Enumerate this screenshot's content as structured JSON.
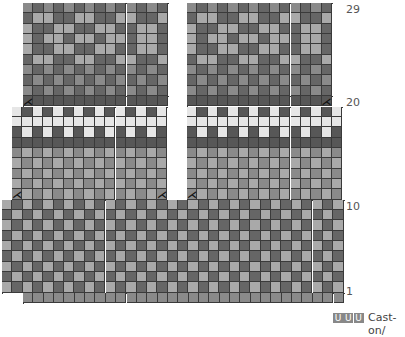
{
  "chart": {
    "cell_px": 10.35,
    "row_labels": [
      {
        "text": "29",
        "row": 29
      },
      {
        "text": "20",
        "row": 20
      },
      {
        "text": "10",
        "row": 10
      },
      {
        "text": "1",
        "row": 1
      }
    ],
    "legend": {
      "cast_on_symbol": "U",
      "cast_on_count": 3,
      "cast_on_label": "Cast-on/"
    },
    "colors": {
      "D": "#666666",
      "M": "#8a8a8a",
      "L": "#a9a9a9",
      "W": "#e6e6e6",
      "K": "#575757",
      "grid": "#3a3a3a"
    },
    "decrease_symbol": "⋌",
    "decreases": [
      {
        "block": "upper-left",
        "row": 20,
        "col": 0
      },
      {
        "block": "upper-right",
        "row": 20,
        "col": 13
      },
      {
        "block": "mid-left",
        "row": 11,
        "col": 0
      },
      {
        "block": "mid-left",
        "row": 11,
        "col": 14
      },
      {
        "block": "mid-right",
        "row": 11,
        "col": 0
      }
    ]
  }
}
